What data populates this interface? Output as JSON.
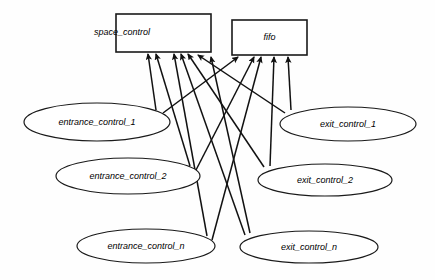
{
  "diagram": {
    "type": "use-case-dependency-diagram",
    "background_color": "#fefefe",
    "stroke_color": "#111111",
    "fill_color": "#ffffff",
    "boxes": [
      {
        "id": "space_control",
        "label": "space_control",
        "x": 116,
        "y": 14,
        "w": 95,
        "h": 38,
        "label_align": "left"
      },
      {
        "id": "fifo",
        "label": "fifo",
        "x": 232,
        "y": 20,
        "w": 75,
        "h": 35,
        "label_align": "center"
      }
    ],
    "ellipses": [
      {
        "id": "entrance_control_1",
        "label": "entrance_control_1",
        "cx": 97,
        "cy": 122,
        "rx": 73,
        "ry": 19
      },
      {
        "id": "entrance_control_2",
        "label": "entrance_control_2",
        "cx": 128,
        "cy": 176,
        "rx": 72,
        "ry": 18
      },
      {
        "id": "entrance_control_n",
        "label": "entrance_control_n",
        "cx": 146,
        "cy": 246,
        "rx": 69,
        "ry": 17
      },
      {
        "id": "exit_control_1",
        "label": "exit_control_1",
        "cx": 348,
        "cy": 124,
        "rx": 68,
        "ry": 17
      },
      {
        "id": "exit_control_2",
        "label": "exit_control_2",
        "cx": 325,
        "cy": 180,
        "rx": 67,
        "ry": 16
      },
      {
        "id": "exit_control_n",
        "label": "exit_control_n",
        "cx": 309,
        "cy": 247,
        "rx": 69,
        "ry": 16
      }
    ],
    "edges": [
      {
        "from": "entrance_control_1",
        "to": "space_control",
        "x1": 156,
        "y1": 110,
        "x2": 148,
        "y2": 54
      },
      {
        "from": "entrance_control_1",
        "to": "fifo",
        "x1": 163,
        "y1": 113,
        "x2": 238,
        "y2": 57
      },
      {
        "from": "entrance_control_2",
        "to": "space_control",
        "x1": 190,
        "y1": 166,
        "x2": 156,
        "y2": 54
      },
      {
        "from": "entrance_control_2",
        "to": "fifo",
        "x1": 196,
        "y1": 170,
        "x2": 254,
        "y2": 57
      },
      {
        "from": "entrance_control_n",
        "to": "space_control",
        "x1": 207,
        "y1": 236,
        "x2": 174,
        "y2": 54
      },
      {
        "from": "entrance_control_n",
        "to": "fifo",
        "x1": 212,
        "y1": 240,
        "x2": 261,
        "y2": 57
      },
      {
        "from": "exit_control_1",
        "to": "space_control",
        "x1": 285,
        "y1": 113,
        "x2": 198,
        "y2": 55
      },
      {
        "from": "exit_control_1",
        "to": "fifo",
        "x1": 291,
        "y1": 110,
        "x2": 288,
        "y2": 57
      },
      {
        "from": "exit_control_2",
        "to": "space_control",
        "x1": 264,
        "y1": 167,
        "x2": 188,
        "y2": 54
      },
      {
        "from": "exit_control_2",
        "to": "fifo",
        "x1": 270,
        "y1": 166,
        "x2": 274,
        "y2": 57
      },
      {
        "from": "exit_control_n",
        "to": "space_control",
        "x1": 245,
        "y1": 235,
        "x2": 181,
        "y2": 54
      },
      {
        "from": "exit_control_n",
        "to": "fifo",
        "x1": 250,
        "y1": 233,
        "x2": 211,
        "y2": 57
      }
    ]
  }
}
